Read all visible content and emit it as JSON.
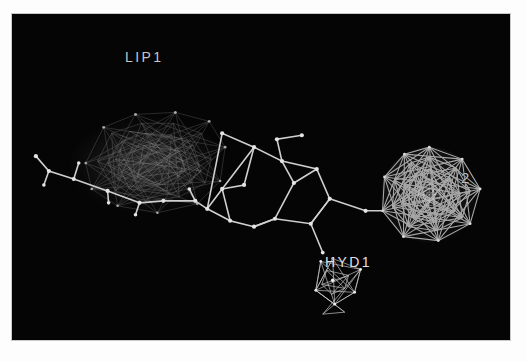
{
  "window": {
    "background_color": "#fdfdfd",
    "canvas_color": "#050505",
    "border_color": "#c9c9c9"
  },
  "viewer": {
    "type": "3d-molecular-pharmacophore",
    "width": 500,
    "height": 328
  },
  "labels": {
    "lipophilic": "LIP1",
    "hydrophobic": "HYD1",
    "acceptor": "2"
  },
  "features": [
    {
      "name": "LIP1",
      "kind": "lipophilic-cloud",
      "color": "#9a9a9a",
      "center": [
        135,
        155
      ],
      "radius": 68
    },
    {
      "name": "HYD1",
      "kind": "hydrogen-bond-cone",
      "color": "#d0d0d0",
      "center": [
        327,
        272
      ],
      "radius": 26
    },
    {
      "name": "2",
      "kind": "geodesic-sphere",
      "color": "#a8a8a8",
      "center": [
        419,
        182
      ],
      "radius": 46
    }
  ],
  "molecule": {
    "bond_color": "#cfcfcf",
    "atom_color": "#dddddd",
    "atoms": [
      [
        24,
        143
      ],
      [
        37,
        158
      ],
      [
        62,
        148
      ],
      [
        67,
        166
      ],
      [
        75,
        180
      ],
      [
        96,
        178
      ],
      [
        97,
        186
      ],
      [
        110,
        132
      ],
      [
        116,
        170
      ],
      [
        128,
        190
      ],
      [
        131,
        150
      ],
      [
        152,
        188
      ],
      [
        162,
        124
      ],
      [
        172,
        160
      ],
      [
        184,
        188
      ],
      [
        196,
        196
      ],
      [
        211,
        120
      ],
      [
        219,
        208
      ],
      [
        233,
        196
      ],
      [
        243,
        134
      ],
      [
        266,
        140
      ],
      [
        271,
        180
      ],
      [
        276,
        243
      ],
      [
        283,
        170
      ],
      [
        291,
        148
      ],
      [
        300,
        211
      ],
      [
        306,
        246
      ],
      [
        319,
        143
      ],
      [
        324,
        176
      ],
      [
        331,
        207
      ],
      [
        346,
        212
      ],
      [
        362,
        214
      ],
      [
        373,
        202
      ],
      [
        387,
        196
      ]
    ],
    "bonds": [
      [
        0,
        1
      ],
      [
        1,
        3
      ],
      [
        3,
        8
      ],
      [
        8,
        13
      ],
      [
        2,
        3
      ],
      [
        4,
        5
      ],
      [
        5,
        6
      ],
      [
        6,
        9
      ],
      [
        9,
        11
      ],
      [
        11,
        14
      ],
      [
        14,
        15
      ],
      [
        15,
        17
      ],
      [
        17,
        18
      ],
      [
        12,
        16
      ],
      [
        16,
        19
      ],
      [
        19,
        20
      ],
      [
        20,
        23
      ],
      [
        23,
        21
      ],
      [
        21,
        18
      ],
      [
        18,
        22
      ],
      [
        22,
        25
      ],
      [
        25,
        29
      ],
      [
        29,
        31
      ],
      [
        31,
        28
      ],
      [
        28,
        23
      ],
      [
        24,
        27
      ],
      [
        27,
        26
      ],
      [
        28,
        32
      ],
      [
        32,
        33
      ],
      [
        29,
        30
      ]
    ]
  }
}
